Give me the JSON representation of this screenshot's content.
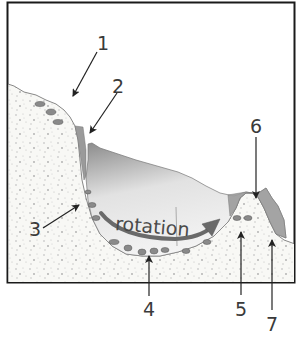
{
  "diagram": {
    "rotation_label": "rotation",
    "labels": [
      {
        "id": "1",
        "text": "1"
      },
      {
        "id": "2",
        "text": "2"
      },
      {
        "id": "3",
        "text": "3"
      },
      {
        "id": "4",
        "text": "4"
      },
      {
        "id": "5",
        "text": "5"
      },
      {
        "id": "6",
        "text": "6"
      },
      {
        "id": "7",
        "text": "7"
      }
    ],
    "colors": {
      "frame": "#1a1a1a",
      "rock_fill": "#f7f7f4",
      "rock_speckle": "#b8b8b8",
      "ice_dark": "#8f8f8f",
      "ice_light": "#f2f2f2",
      "arrow": "#6e6e6e",
      "pointer": "#222222",
      "debris": "#7a7a7a"
    }
  }
}
